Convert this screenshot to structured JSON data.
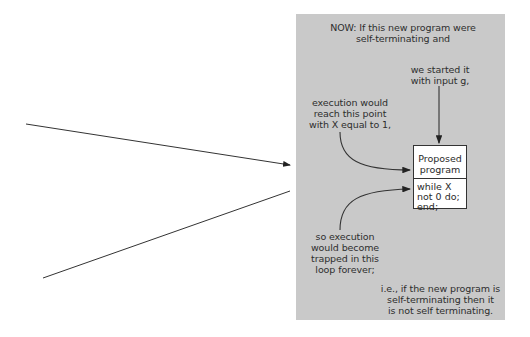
{
  "panel": {
    "background": "#c9c9c9",
    "heading": "NOW: If this new program were\nself-terminating and",
    "input_note": "we started it\nwith input g,",
    "reach_note": "execution would\nreach this point\nwith X equal to 1,",
    "trap_note": "so execution\nwould become\ntrapped in this\nloop forever;",
    "conclusion": "i.e., if the new program is\nself-terminating then it\nis not self terminating."
  },
  "program_box": {
    "top_label": "Proposed\nprogram",
    "loop_code": "while X\n not 0 do;\nend;"
  },
  "external_lines": {
    "upper": "arrow pointing into panel",
    "lower": "line leaving panel"
  }
}
